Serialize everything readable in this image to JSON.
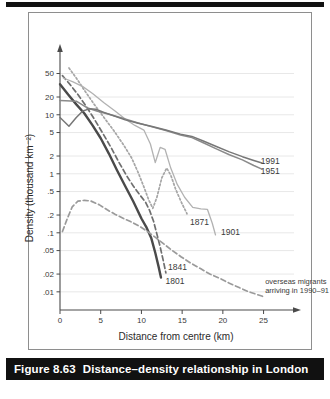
{
  "figure": {
    "number": "Figure 8.63",
    "caption": "Distance–density relationship in London"
  },
  "chart_data": {
    "type": "line",
    "title": "Distance–density relationship in London",
    "xlabel": "Distance from centre (km)",
    "ylabel": "Density (thousand km⁻²)",
    "xlim": [
      0,
      28
    ],
    "ylim": [
      0.008,
      70
    ],
    "yscale": "log",
    "grid": true,
    "legend_position": "inline-right-of-curve",
    "xticks": [
      "0",
      "5",
      "10",
      "15",
      "20",
      "25"
    ],
    "xtick_values": [
      0,
      5,
      10,
      15,
      20,
      25
    ],
    "yticks": [
      "50",
      "20",
      "10",
      "5",
      "2",
      "1",
      ".5",
      ".2",
      ".1",
      ".05",
      ".02",
      ".01"
    ],
    "ytick_values": [
      50,
      20,
      10,
      5,
      2,
      1,
      0.5,
      0.2,
      0.1,
      0.05,
      0.02,
      0.01
    ],
    "annotations": [
      {
        "id": "overseas-migrants",
        "line1": "overseas migrants",
        "line2": "arriving in 1990–91",
        "x": 25.2,
        "y": 0.0135
      }
    ],
    "series": [
      {
        "name": "1801",
        "label": "1801",
        "style": "solid-thick",
        "color": "#4a4a4a",
        "width": 2.4,
        "dash": "",
        "label_x": 12.6,
        "label_y": 0.0155,
        "points": [
          [
            0.0,
            33
          ],
          [
            1.0,
            22
          ],
          [
            2.0,
            15
          ],
          [
            3.0,
            10.5
          ],
          [
            4.0,
            6.6
          ],
          [
            5.0,
            4.0
          ],
          [
            6.0,
            2.2
          ],
          [
            7.0,
            1.15
          ],
          [
            8.0,
            0.62
          ],
          [
            9.0,
            0.34
          ],
          [
            10.0,
            0.175
          ],
          [
            10.6,
            0.125
          ],
          [
            11.2,
            0.082
          ],
          [
            11.7,
            0.046
          ],
          [
            12.1,
            0.027
          ],
          [
            12.4,
            0.0175
          ]
        ]
      },
      {
        "name": "1841",
        "label": "1841",
        "style": "dashed",
        "color": "#6f6f6f",
        "width": 1.7,
        "dash": "5,3",
        "label_x": 12.9,
        "label_y": 0.0265,
        "points": [
          [
            0.3,
            46
          ],
          [
            1.2,
            33
          ],
          [
            2.2,
            22
          ],
          [
            3.2,
            14
          ],
          [
            4.2,
            8.5
          ],
          [
            5.2,
            5.0
          ],
          [
            6.2,
            2.9
          ],
          [
            7.2,
            1.6
          ],
          [
            8.2,
            0.92
          ],
          [
            9.0,
            0.62
          ],
          [
            9.8,
            0.44
          ],
          [
            10.5,
            0.33
          ],
          [
            11.0,
            0.24
          ],
          [
            11.5,
            0.155
          ],
          [
            11.9,
            0.095
          ],
          [
            12.3,
            0.058
          ],
          [
            12.7,
            0.033
          ],
          [
            13.0,
            0.021
          ]
        ]
      },
      {
        "name": "1871",
        "label": "1871",
        "style": "dotted",
        "color": "#a6a6a6",
        "width": 1.7,
        "dash": "1.8,2.2",
        "label_x": 15.6,
        "label_y": 0.155,
        "points": [
          [
            1.1,
            62
          ],
          [
            2.0,
            42
          ],
          [
            3.0,
            26
          ],
          [
            4.2,
            15
          ],
          [
            5.4,
            9.0
          ],
          [
            6.6,
            5.4
          ],
          [
            7.8,
            3.1
          ],
          [
            8.8,
            1.85
          ],
          [
            9.6,
            1.05
          ],
          [
            10.3,
            0.6
          ],
          [
            10.9,
            0.36
          ],
          [
            11.4,
            0.26
          ],
          [
            11.9,
            0.4
          ],
          [
            12.5,
            0.85
          ],
          [
            13.1,
            1.25
          ],
          [
            13.6,
            0.95
          ],
          [
            14.2,
            0.55
          ],
          [
            14.9,
            0.33
          ],
          [
            15.6,
            0.21
          ]
        ]
      },
      {
        "name": "1901",
        "label": "1901",
        "style": "solid-thin",
        "color": "#b2b2b2",
        "width": 1.3,
        "label_x": 19.4,
        "label_y": 0.105,
        "points": [
          [
            0.4,
            42
          ],
          [
            1.6,
            36
          ],
          [
            2.8,
            30
          ],
          [
            4.0,
            23
          ],
          [
            5.4,
            16
          ],
          [
            6.8,
            11.5
          ],
          [
            8.0,
            8.5
          ],
          [
            9.2,
            6.6
          ],
          [
            10.3,
            5.5
          ],
          [
            11.1,
            3.2
          ],
          [
            11.7,
            1.55
          ],
          [
            12.3,
            2.8
          ],
          [
            12.9,
            2.6
          ],
          [
            13.6,
            1.25
          ],
          [
            14.4,
            0.66
          ],
          [
            15.3,
            0.4
          ],
          [
            16.3,
            0.27
          ],
          [
            17.3,
            0.255
          ],
          [
            18.1,
            0.25
          ],
          [
            18.7,
            0.145
          ],
          [
            19.1,
            0.092
          ]
        ]
      },
      {
        "name": "1951",
        "label": "1951",
        "style": "solid-medium",
        "color": "#8a8a8a",
        "width": 1.5,
        "label_x": 24.3,
        "label_y": 1.12,
        "points": [
          [
            0.0,
            17.5
          ],
          [
            2.0,
            17.0
          ],
          [
            3.4,
            13.0
          ],
          [
            4.6,
            11.5
          ],
          [
            6.0,
            10.2
          ],
          [
            7.6,
            8.8
          ],
          [
            9.4,
            7.4
          ],
          [
            11.2,
            6.3
          ],
          [
            13.0,
            5.4
          ],
          [
            14.8,
            4.55
          ],
          [
            16.2,
            4.1
          ],
          [
            17.6,
            3.35
          ],
          [
            19.2,
            2.65
          ],
          [
            20.8,
            2.1
          ],
          [
            22.4,
            1.72
          ],
          [
            23.8,
            1.38
          ],
          [
            24.8,
            1.2
          ]
        ]
      },
      {
        "name": "1991",
        "label": "1991",
        "style": "solid-medium",
        "color": "#777777",
        "width": 1.5,
        "label_x": 24.3,
        "label_y": 1.62,
        "points": [
          [
            0.0,
            9.0
          ],
          [
            1.1,
            6.4
          ],
          [
            2.0,
            9.0
          ],
          [
            2.8,
            11.6
          ],
          [
            3.6,
            12.6
          ],
          [
            4.4,
            12.4
          ],
          [
            5.4,
            11.0
          ],
          [
            6.6,
            9.6
          ],
          [
            8.0,
            8.2
          ],
          [
            9.6,
            7.2
          ],
          [
            11.2,
            6.4
          ],
          [
            13.0,
            5.5
          ],
          [
            14.8,
            4.7
          ],
          [
            16.2,
            4.3
          ],
          [
            17.6,
            3.6
          ],
          [
            19.2,
            2.9
          ],
          [
            20.8,
            2.35
          ],
          [
            22.4,
            1.95
          ],
          [
            23.8,
            1.68
          ],
          [
            24.8,
            1.52
          ]
        ]
      },
      {
        "name": "overseas-migrants-1990-91",
        "label": "overseas migrants arriving in 1990–91",
        "style": "dashed-light",
        "color": "#9a9a9a",
        "width": 1.7,
        "dash": "5,3",
        "label_x": null,
        "label_y": null,
        "points": [
          [
            0.3,
            0.105
          ],
          [
            0.9,
            0.175
          ],
          [
            1.5,
            0.275
          ],
          [
            2.2,
            0.345
          ],
          [
            3.0,
            0.355
          ],
          [
            3.8,
            0.345
          ],
          [
            4.8,
            0.3
          ],
          [
            5.8,
            0.245
          ],
          [
            6.8,
            0.205
          ],
          [
            7.8,
            0.175
          ],
          [
            8.8,
            0.152
          ],
          [
            9.8,
            0.128
          ],
          [
            10.8,
            0.104
          ],
          [
            11.8,
            0.082
          ],
          [
            12.8,
            0.064
          ],
          [
            13.8,
            0.05
          ],
          [
            14.9,
            0.039
          ],
          [
            16.0,
            0.031
          ],
          [
            17.2,
            0.025
          ],
          [
            18.4,
            0.02
          ],
          [
            19.6,
            0.017
          ],
          [
            20.8,
            0.014
          ],
          [
            22.0,
            0.0118
          ],
          [
            23.2,
            0.01
          ],
          [
            24.2,
            0.009
          ],
          [
            25.0,
            0.0083
          ]
        ]
      }
    ]
  }
}
